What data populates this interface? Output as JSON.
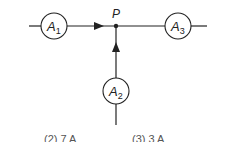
{
  "diagram": {
    "junction_label": "P",
    "ammeters": [
      {
        "id": "A1",
        "base": "A",
        "sub": "1"
      },
      {
        "id": "A2",
        "base": "A",
        "sub": "2"
      },
      {
        "id": "A3",
        "base": "A",
        "sub": "3"
      }
    ],
    "line_color": "#222222"
  },
  "options_partial": [
    {
      "label": "(2)  7 A"
    },
    {
      "label": "(3)  3 A"
    }
  ]
}
